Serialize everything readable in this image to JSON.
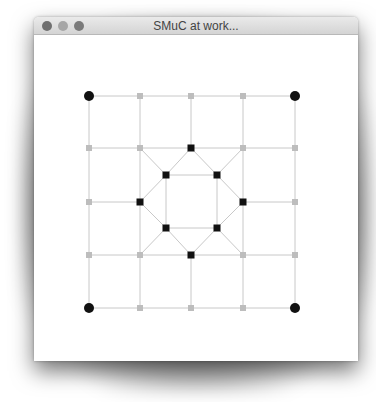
{
  "window": {
    "title": "SMuC at work...",
    "buttons": [
      "close",
      "minimize",
      "maximize"
    ]
  },
  "graph": {
    "colors": {
      "edge": "#c8c8c8",
      "corner": "#111111",
      "inner": "#111111",
      "outer": "#bdbdbd"
    },
    "grid_x": [
      89,
      140,
      191,
      243,
      295
    ],
    "grid_y": [
      96,
      148,
      202,
      255,
      308
    ],
    "corner_nodes": [
      [
        89,
        96
      ],
      [
        295,
        96
      ],
      [
        89,
        308
      ],
      [
        295,
        308
      ]
    ],
    "outer_nodes": [
      [
        140,
        96
      ],
      [
        191,
        96
      ],
      [
        243,
        96
      ],
      [
        89,
        148
      ],
      [
        140,
        148
      ],
      [
        243,
        148
      ],
      [
        295,
        148
      ],
      [
        89,
        202
      ],
      [
        295,
        202
      ],
      [
        89,
        255
      ],
      [
        140,
        255
      ],
      [
        243,
        255
      ],
      [
        295,
        255
      ],
      [
        140,
        308
      ],
      [
        191,
        308
      ],
      [
        243,
        308
      ]
    ],
    "inner_nodes": [
      [
        191,
        148
      ],
      [
        166,
        175
      ],
      [
        217,
        175
      ],
      [
        140,
        202
      ],
      [
        243,
        202
      ],
      [
        166,
        228
      ],
      [
        217,
        228
      ],
      [
        191,
        255
      ]
    ]
  }
}
